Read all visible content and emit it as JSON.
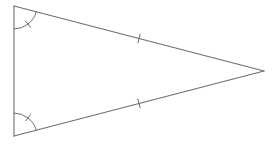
{
  "diagram": {
    "type": "isosceles-triangle",
    "stroke_color": "#6e6e6e",
    "background_color": "#ffffff",
    "vertices": [
      "top-left",
      "bottom-left",
      "apex-right"
    ],
    "equal_sides": [
      "top-left to apex",
      "bottom-left to apex"
    ],
    "side_tick_count": 1,
    "equal_angles": [
      "top-left",
      "bottom-left"
    ],
    "angle_arc_tick_count": 1,
    "labels": []
  }
}
